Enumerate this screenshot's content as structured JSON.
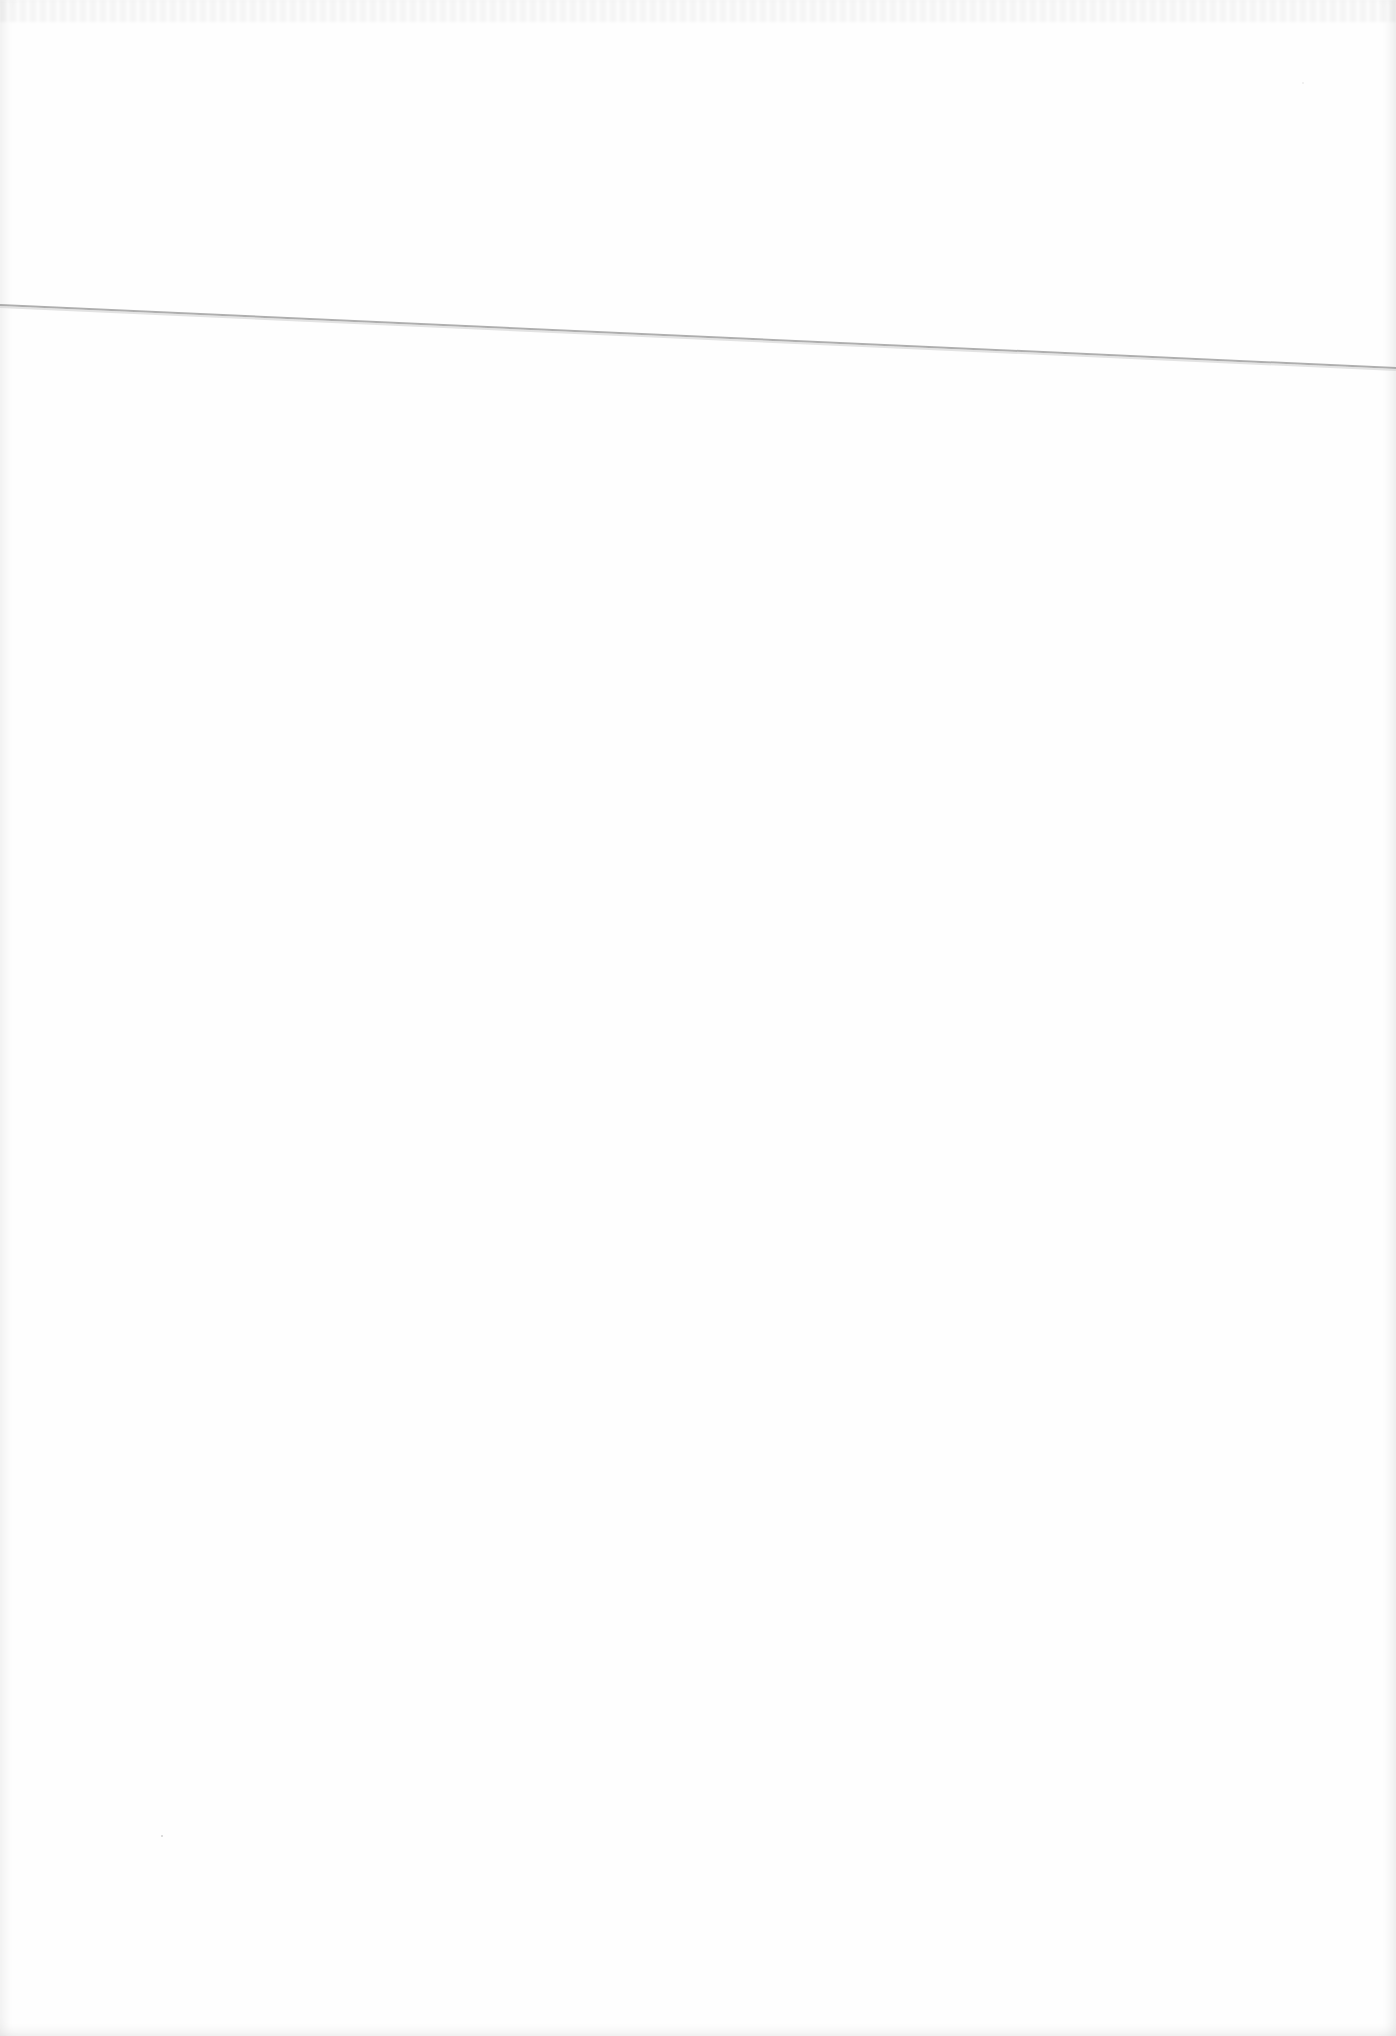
{
  "page": {
    "background": "#fefefe",
    "content_text": ""
  },
  "crease": {
    "x1": 0,
    "y1": 305,
    "x2": 1396,
    "y2": 368,
    "color": "#9a9a9a",
    "width": 2
  }
}
